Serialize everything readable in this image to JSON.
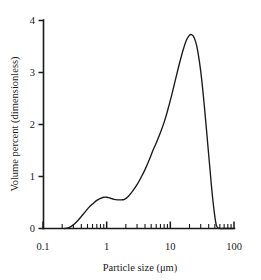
{
  "chart_data": {
    "type": "line",
    "title": "",
    "xlabel": "Particle size (μm)",
    "ylabel": "Volume percent (dimensionless)",
    "xscale": "log",
    "yscale": "linear",
    "xlim": [
      0.1,
      100
    ],
    "ylim": [
      0,
      4
    ],
    "grid": false,
    "legend": null,
    "x_tick_labels": [
      "0.1",
      "1",
      "10",
      "100"
    ],
    "x_tick_values": [
      0.1,
      1,
      10,
      100
    ],
    "y_tick_labels": [
      "0",
      "1",
      "2",
      "3",
      "4"
    ],
    "y_tick_values": [
      0,
      1,
      2,
      3,
      4
    ],
    "x_minor_ticks": [
      0.2,
      0.3,
      0.4,
      0.5,
      0.6,
      0.7,
      0.8,
      0.9,
      2,
      3,
      4,
      5,
      6,
      7,
      8,
      9,
      20,
      30,
      40,
      50,
      60,
      70,
      80,
      90
    ],
    "annotations": [
      {
        "text": "primary mode",
        "x": 21.0,
        "y": 3.7
      },
      {
        "text": "secondary shoulder",
        "x": 1.0,
        "y": 0.6
      }
    ],
    "series": [
      {
        "name": "Volume percent distribution",
        "color": "#1a1a1a",
        "x": [
          0.22,
          0.26,
          0.3,
          0.35,
          0.4,
          0.46,
          0.53,
          0.6,
          0.7,
          0.8,
          0.9,
          1.0,
          1.15,
          1.3,
          1.5,
          1.7,
          1.9,
          2.2,
          2.6,
          3.0,
          3.5,
          4.0,
          4.6,
          5.3,
          6.0,
          7.0,
          8.0,
          9.0,
          10.5,
          12.0,
          14.0,
          16.0,
          18.0,
          20.0,
          21.5,
          23.0,
          25.0,
          27.0,
          30.0,
          33.0,
          36.0,
          40.0,
          44.0,
          48.0,
          52.0,
          55.0,
          60.0,
          70.0,
          100.0
        ],
        "y": [
          0.0,
          0.02,
          0.07,
          0.15,
          0.23,
          0.32,
          0.41,
          0.47,
          0.54,
          0.58,
          0.6,
          0.6,
          0.58,
          0.56,
          0.55,
          0.55,
          0.56,
          0.62,
          0.73,
          0.84,
          0.99,
          1.13,
          1.3,
          1.49,
          1.64,
          1.84,
          2.04,
          2.25,
          2.56,
          2.85,
          3.18,
          3.44,
          3.62,
          3.71,
          3.72,
          3.69,
          3.58,
          3.4,
          3.02,
          2.55,
          2.05,
          1.42,
          0.85,
          0.4,
          0.1,
          0.02,
          0.0,
          0.0,
          0.0
        ]
      }
    ]
  },
  "axes": {
    "x_title": "Particle size (μm)",
    "y_title": "Volume percent (dimensionless)"
  }
}
